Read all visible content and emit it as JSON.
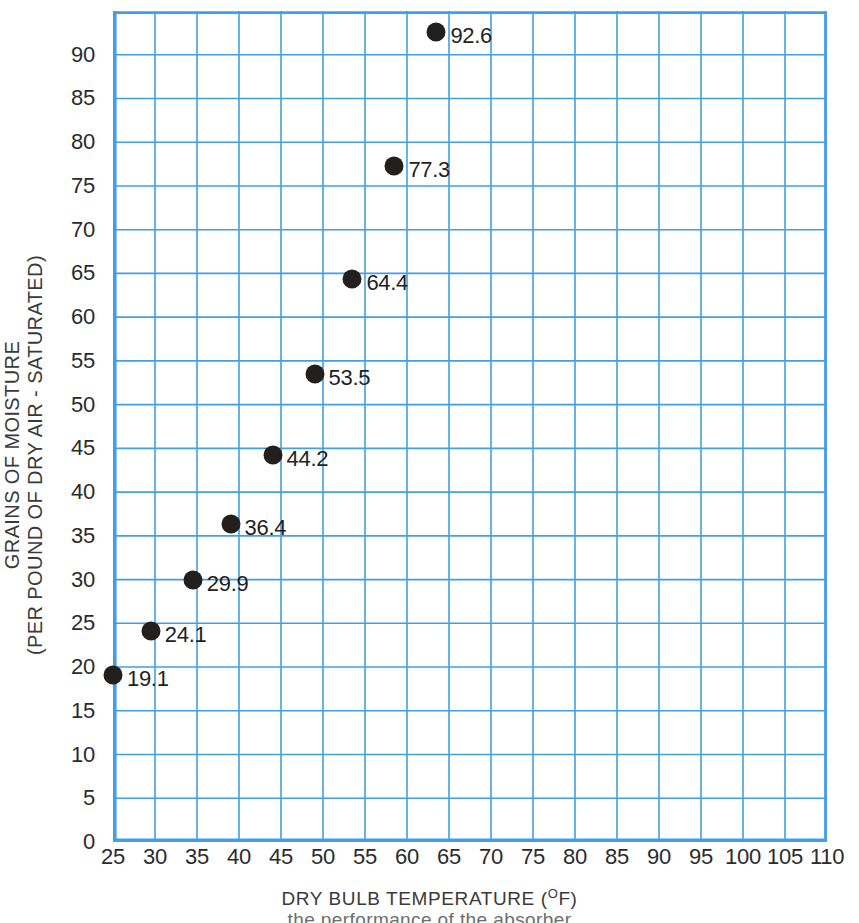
{
  "chart_data": {
    "type": "scatter",
    "title": "",
    "xlabel": "DRY BULB TEMPERATURE (°F)",
    "ylabel": "GRAINS OF MOISTURE (PER POUND OF DRY AIR - SATURATED)",
    "xlim": [
      25,
      110
    ],
    "ylim": [
      0,
      95
    ],
    "grid": true,
    "legend": "none",
    "x": [
      25,
      29.5,
      34.5,
      39,
      44,
      49,
      53.5,
      58.5,
      63.5
    ],
    "values": [
      19.1,
      24.1,
      29.9,
      36.4,
      44.2,
      53.5,
      64.4,
      77.3,
      92.6
    ],
    "point_labels": [
      "19.1",
      "24.1",
      "29.9",
      "36.4",
      "44.2",
      "53.5",
      "64.4",
      "77.3",
      "92.6"
    ],
    "xticks": [
      25,
      30,
      35,
      40,
      45,
      50,
      55,
      60,
      65,
      70,
      75,
      80,
      85,
      90,
      95,
      100,
      105,
      110
    ],
    "xtick_labels": [
      "25",
      "30",
      "35",
      "40",
      "45",
      "50",
      "55",
      "60",
      "65",
      "70",
      "75",
      "80",
      "85",
      "90",
      "95",
      "100",
      "105",
      "110"
    ],
    "yticks": [
      0,
      5,
      10,
      15,
      20,
      25,
      30,
      35,
      40,
      45,
      50,
      55,
      60,
      65,
      70,
      75,
      80,
      85,
      90
    ],
    "ytick_labels": [
      "0",
      "5",
      "10",
      "15",
      "20",
      "25",
      "30",
      "35",
      "40",
      "45",
      "50",
      "55",
      "60",
      "65",
      "70",
      "75",
      "80",
      "85",
      "90"
    ],
    "colors": {
      "grid": "#3fa0e8",
      "axis": "#3fa0e8",
      "marker": "#231f1c",
      "text": "#2b2b2b",
      "background": "#ffffff"
    }
  },
  "axes": {
    "x_title_main": "DRY BULB TEMPERATURE (",
    "x_title_sup": "O",
    "x_title_tail": "F)",
    "y_title_line1": "GRAINS OF MOISTURE",
    "y_title_line2": "(PER POUND OF DRY AIR - SATURATED)"
  },
  "caption": {
    "clipped_text": "the performance of the absorber"
  }
}
